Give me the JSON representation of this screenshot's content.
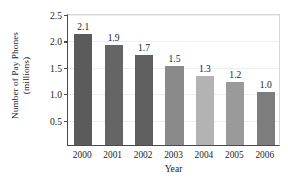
{
  "chart_data": {
    "type": "bar",
    "title": "",
    "xlabel": "Year",
    "ylabel_line1": "Number of Pay Phones",
    "ylabel_line2": "(millions)",
    "categories": [
      "2000",
      "2001",
      "2002",
      "2003",
      "2004",
      "2005",
      "2006"
    ],
    "values": [
      2.1,
      1.9,
      1.7,
      1.5,
      1.3,
      1.2,
      1.0
    ],
    "value_labels": [
      "2.1",
      "1.9",
      "1.7",
      "1.5",
      "1.3",
      "1.2",
      "1.0"
    ],
    "ytick_labels": [
      "2.5",
      "2.0",
      "1.5",
      "1.0",
      "0.5"
    ],
    "ytick_values": [
      2.5,
      2.0,
      1.5,
      1.0,
      0.5
    ],
    "ylim": [
      0,
      2.5
    ],
    "grid": true,
    "legend": "none",
    "bar_colors": [
      "#5b5b5b",
      "#656565",
      "#5f5f5f",
      "#8a8a8a",
      "#b3b3b3",
      "#9a9a9a",
      "#7d7d7d"
    ]
  }
}
